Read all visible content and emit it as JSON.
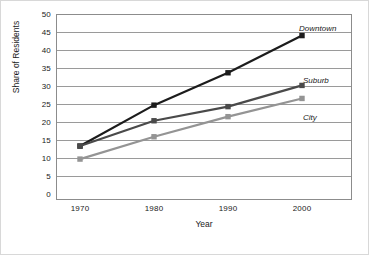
{
  "chart_data": {
    "type": "line",
    "title": "",
    "xlabel": "Year",
    "ylabel": "Share of Residents",
    "categories": [
      "1970",
      "1980",
      "1990",
      "2000"
    ],
    "x": [
      1970,
      1980,
      1990,
      2000
    ],
    "xlim": [
      1965,
      2005
    ],
    "ylim": [
      0,
      50
    ],
    "ytick_labels": [
      "0",
      "5",
      "10",
      "15",
      "20",
      "25",
      "30",
      "35",
      "40",
      "45",
      "50"
    ],
    "ytick_values": [
      0,
      5,
      10,
      15,
      20,
      25,
      30,
      35,
      40,
      45,
      50
    ],
    "grid": "horizontal",
    "legend_position": "inline-right",
    "marker": "square",
    "series": [
      {
        "name": "Downtown",
        "values": [
          14.5,
          25.5,
          34.2,
          44.2
        ],
        "color": "#1c1c1c"
      },
      {
        "name": "Suburb",
        "values": [
          14.5,
          21.3,
          25.1,
          30.8
        ],
        "color": "#4a4a4a"
      },
      {
        "name": "City",
        "values": [
          11.0,
          17.0,
          22.4,
          27.3
        ],
        "color": "#949494"
      }
    ]
  },
  "axes": {
    "y_label": "Share of Residents",
    "x_label": "Year",
    "y_ticks": [
      "50",
      "45",
      "40",
      "35",
      "30",
      "25",
      "20",
      "15",
      "10",
      "5",
      "0"
    ],
    "x_ticks": [
      "1970",
      "1980",
      "1990",
      "2000"
    ]
  },
  "annotations": {
    "downtown": "Downtown",
    "suburb": "Suburb",
    "city": "City"
  },
  "colors": {
    "downtown": "#1c1c1c",
    "suburb": "#4a4a4a",
    "city": "#949494",
    "gridline": "#9a9a9a",
    "axis": "#8c8c8c",
    "frame": "#d8d8d8",
    "text": "#1a1a1a"
  }
}
